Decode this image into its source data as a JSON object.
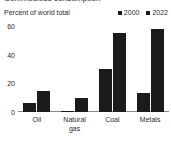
{
  "chart_data": {
    "type": "bar",
    "title": "Commodities consumption",
    "subtitle": "Percent of world total",
    "xlabel": "",
    "ylabel": "Percent of world total",
    "ylim": [
      0,
      60
    ],
    "yticks": [
      0,
      20,
      40,
      60
    ],
    "ytick_labels": [
      "0",
      "20",
      "40",
      "60"
    ],
    "grid": false,
    "legend_position": "top-right",
    "categories": [
      "Oil",
      "Natural\ngas",
      "Coal",
      "Metals"
    ],
    "series": [
      {
        "name": "2000",
        "color": "#1b1b1b",
        "values": [
          6,
          1,
          30,
          13
        ]
      },
      {
        "name": "2022",
        "color": "#1b1b1b",
        "values": [
          15,
          10,
          55,
          58
        ]
      }
    ]
  },
  "colors": {
    "background": "#ffffff",
    "bar": "#1b1b1b",
    "axis": "#8a8a8a",
    "text": "#2b2b2b"
  }
}
